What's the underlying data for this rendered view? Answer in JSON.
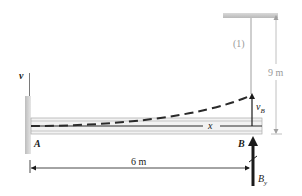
{
  "diagram": {
    "type": "beam deflection free-body diagram",
    "labels": {
      "v_axis": "v",
      "point_a": "A",
      "point_b": "B",
      "x_axis": "x",
      "deflection_b": "v",
      "deflection_b_sub": "B",
      "reaction_b": "B",
      "reaction_b_sub": "y",
      "member": "(1)",
      "rod_length": "9 m",
      "beam_length": "6 m"
    },
    "colors": {
      "beam": "#d8d8d8",
      "beam_edge": "#a8a8a8",
      "wall": "#cfcfcf",
      "ceiling": "#cfcfcf",
      "rod": "#c8c8c8",
      "ink": "#1a1a1a",
      "dim_light": "#a0a0a0"
    }
  }
}
